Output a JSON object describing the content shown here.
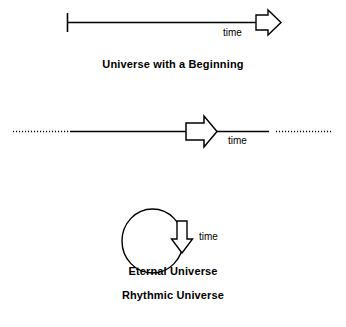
{
  "figure": {
    "background_color": "#ffffff",
    "stroke_color": "#000000",
    "fill_color": "#ffffff"
  },
  "panels": [
    {
      "id": "universe-with-a-beginning",
      "caption": "Universe with a Beginning",
      "time_label": "time",
      "axis": {
        "type": "ray",
        "start_cap": "tick",
        "end_cap": "block-arrow",
        "left_extension": "none",
        "right_extension": "none"
      }
    },
    {
      "id": "eternal-universe",
      "caption": "Eternal Universe",
      "time_label": "time",
      "axis": {
        "type": "line",
        "start_cap": "dotted",
        "end_cap": "dotted",
        "left_extension": "dotted",
        "right_extension": "dotted",
        "mid_marker": "block-arrow"
      }
    },
    {
      "id": "rhythmic-universe",
      "caption": "Rhythmic Universe",
      "time_label": "time",
      "axis": {
        "type": "circle",
        "direction": "clockwise",
        "mid_marker": "block-arrow-down"
      }
    }
  ]
}
